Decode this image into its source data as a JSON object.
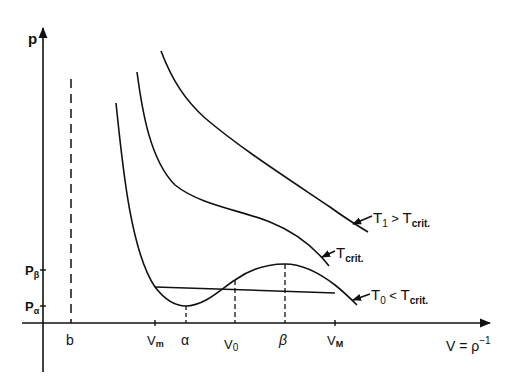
{
  "diagram": {
    "type": "van der Waals isotherms (p-V diagram)",
    "axes": {
      "y_label": "p",
      "x_label": "V = ρ⁻¹",
      "x_label_main": "V = ρ",
      "x_label_sup": "−1"
    },
    "y_ticks": [
      {
        "label": "Pβ",
        "main": "P",
        "sub": "β"
      },
      {
        "label": "Pα",
        "main": "P",
        "sub": "α"
      }
    ],
    "x_ticks": [
      {
        "label": "b"
      },
      {
        "label": "Vm",
        "main": "V",
        "sub": "m"
      },
      {
        "label": "α"
      },
      {
        "label": "V0",
        "main": "V",
        "sub": "0"
      },
      {
        "label": "β"
      },
      {
        "label": "VM",
        "main": "V",
        "sub": "M"
      }
    ],
    "curves": [
      {
        "id": "T1",
        "label": "T1 > Tcrit.",
        "parts": {
          "t": "T",
          "sub1": "1",
          "rel": " > ",
          "t2": "T",
          "sub2": "crit."
        }
      },
      {
        "id": "Tcrit",
        "label": "Tcrit.",
        "parts": {
          "t": "T",
          "sub": "crit."
        }
      },
      {
        "id": "T0",
        "label": "T0 < Tcrit.",
        "parts": {
          "t": "T",
          "sub1": "0",
          "rel": " < ",
          "t2": "T",
          "sub2": "crit."
        }
      }
    ],
    "colors": {
      "ink": "#111111",
      "background": "#ffffff"
    }
  }
}
